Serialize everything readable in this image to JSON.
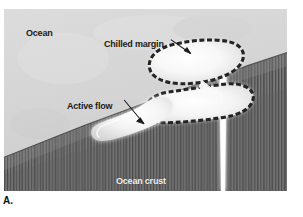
{
  "figure": {
    "panel_letter": "A.",
    "caption_labels": {
      "ocean": "Ocean",
      "chilled_margin": "Chilled margin",
      "active_flow": "Active flow",
      "ocean_crust": "Ocean crust"
    }
  },
  "diagram": {
    "type": "cross-section-illustration",
    "colors": {
      "water": "#d5d5d5",
      "crust_dark": "#6d6d6d",
      "crust_stripes": "#4f4f4f",
      "lava_light": "#f6f6f6",
      "chilled_margin_dark": "#2a2a2a",
      "frame_border": "#ffffff",
      "page_background": "#ffffff",
      "label_dark": "#1b1b1b",
      "label_light": "#f2f2f2"
    },
    "elements": [
      {
        "name": "ocean-water",
        "label": "Ocean",
        "description": "Light grey seawater filling the upper-left region above the sloping crust"
      },
      {
        "name": "ocean-crust",
        "label": "Ocean crust",
        "description": "Dark grey vertically-striped basement rock forming a slope descending to the left"
      },
      {
        "name": "feeder-dike",
        "label": "",
        "description": "White vertical conduit rising through the crust feeding the pillow pile"
      },
      {
        "name": "upper-pillow",
        "label": "",
        "description": "Elongated lava pillow with dashed dark chilled margin, upper of the stacked pair"
      },
      {
        "name": "lower-pillow",
        "label": "",
        "description": "Second lava pillow beneath the first, also rimmed by a chilled margin"
      },
      {
        "name": "active-flow-lobe",
        "label": "Active flow",
        "description": "Teardrop-shaped bright lava lobe advancing down the slope to the left"
      },
      {
        "name": "chilled-margin-rim",
        "label": "Chilled margin",
        "description": "Dashed / stippled dark glassy crust rimming each pillow"
      }
    ],
    "annotations": [
      {
        "name": "chilled-margin-leader",
        "text": "Chilled margin",
        "points_to": "upper-pillow-rim"
      },
      {
        "name": "active-flow-leader",
        "text": "Active flow",
        "points_to": "active-flow-lobe"
      }
    ]
  }
}
